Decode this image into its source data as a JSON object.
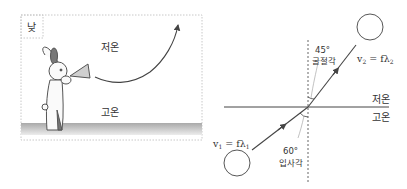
{
  "left_panel": {
    "time_label": "낮",
    "upper_label": "저온",
    "lower_label": "고온",
    "description": "rabbit with megaphone; sound path curves upward"
  },
  "right_panel": {
    "upper_medium_label": "저온",
    "lower_medium_label": "고온",
    "refraction_angle": "45°",
    "refraction_angle_label": "굴절각",
    "incidence_angle": "60°",
    "incidence_angle_label": "입사각",
    "v1_label": "v",
    "v1_sub": "1",
    "v1_rhs": " = fλ",
    "v1_rhs_sub": "1",
    "v2_label": "v",
    "v2_sub": "2",
    "v2_rhs": " = fλ",
    "v2_rhs_sub": "2"
  },
  "colors": {
    "line": "#444444",
    "dashed_border": "#c8c8c8",
    "ground_top": "#a9a9a9",
    "ground_bottom": "#e6e6e6",
    "text": "#333333"
  }
}
